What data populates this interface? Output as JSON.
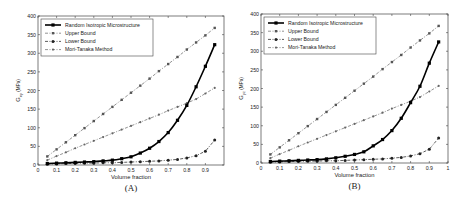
{
  "chart_data": [
    {
      "type": "line",
      "panel_label": "(A)",
      "title": "",
      "xlabel": "Volume fraction",
      "ylabel": "G_xy (MPa)",
      "ylabel_main": "G",
      "ylabel_sub": "xy",
      "ylabel_unit": "(MPa)",
      "xlim": [
        0,
        1
      ],
      "ylim": [
        0,
        400
      ],
      "xticks": [
        0,
        0.1,
        0.2,
        0.3,
        0.4,
        0.5,
        0.6,
        0.7,
        0.8,
        0.9
      ],
      "xtick_labels": [
        "0",
        "0.1",
        "0.2",
        "0.3",
        "0.4",
        "0.5",
        "0.6",
        "0.7",
        "0.8",
        "0.9"
      ],
      "yticks": [
        0,
        50,
        100,
        150,
        200,
        250,
        300,
        350,
        400
      ],
      "ytick_labels": [
        "0",
        "50",
        "100",
        "150",
        "200",
        "250",
        "300",
        "350",
        "400"
      ],
      "grid": false,
      "legend_position": "upper left",
      "x": [
        0.05,
        0.1,
        0.15,
        0.2,
        0.25,
        0.3,
        0.35,
        0.4,
        0.45,
        0.5,
        0.55,
        0.6,
        0.65,
        0.7,
        0.75,
        0.8,
        0.85,
        0.9,
        0.95
      ],
      "series": [
        {
          "name": "Random Isotropic Microstructure",
          "style": "solid-bold-square",
          "values": [
            4,
            5,
            6,
            7,
            8,
            9,
            11,
            13,
            17,
            22,
            32,
            45,
            63,
            87,
            120,
            160,
            210,
            265,
            323
          ]
        },
        {
          "name": "Upper Bound",
          "style": "dashdot-square",
          "values": [
            23,
            42,
            61,
            80,
            99,
            118,
            137,
            156,
            175,
            194,
            213,
            232,
            252,
            271,
            290,
            310,
            329,
            348,
            368
          ]
        },
        {
          "name": "Lower Bound",
          "style": "dashdot-star",
          "values": [
            2,
            3,
            4,
            4,
            5,
            5,
            6,
            6,
            7,
            8,
            9,
            10,
            11,
            13,
            15,
            19,
            25,
            37,
            67
          ]
        },
        {
          "name": "Mori-Tanaka Method",
          "style": "dashdot-dot",
          "values": [
            13,
            24,
            34,
            45,
            55,
            65,
            75,
            85,
            95,
            105,
            115,
            125,
            135,
            146,
            156,
            166,
            177,
            192,
            207
          ]
        }
      ]
    },
    {
      "type": "line",
      "panel_label": "(B)",
      "title": "",
      "xlabel": "Volume fraction",
      "ylabel": "G_yz (MPa)",
      "ylabel_main": "G",
      "ylabel_sub": "yz",
      "ylabel_unit": "(MPa)",
      "xlim": [
        0,
        1
      ],
      "ylim": [
        0,
        400
      ],
      "xticks": [
        0,
        0.1,
        0.2,
        0.3,
        0.4,
        0.5,
        0.6,
        0.7,
        0.8,
        0.9,
        1
      ],
      "xtick_labels": [
        "0",
        "0.1",
        "0.2",
        "0.3",
        "0.4",
        "0.5",
        "0.6",
        "0.7",
        "0.8",
        "0.9",
        "1"
      ],
      "yticks": [
        0,
        50,
        100,
        150,
        200,
        250,
        300,
        350,
        400
      ],
      "ytick_labels": [
        "0",
        "50",
        "100",
        "150",
        "200",
        "250",
        "300",
        "350",
        "400"
      ],
      "grid": false,
      "legend_position": "upper left",
      "x": [
        0.05,
        0.1,
        0.15,
        0.2,
        0.25,
        0.3,
        0.35,
        0.4,
        0.45,
        0.5,
        0.55,
        0.6,
        0.65,
        0.7,
        0.75,
        0.8,
        0.85,
        0.9,
        0.95
      ],
      "series": [
        {
          "name": "Random Isotropic Microstructure",
          "style": "solid-bold-square",
          "values": [
            4,
            5,
            6,
            7,
            8,
            9,
            11,
            14,
            18,
            23,
            30,
            46,
            63,
            87,
            120,
            162,
            206,
            268,
            325
          ]
        },
        {
          "name": "Upper Bound",
          "style": "dashdot-square",
          "values": [
            23,
            42,
            61,
            80,
            99,
            118,
            137,
            156,
            175,
            194,
            213,
            232,
            252,
            271,
            290,
            310,
            329,
            348,
            368
          ]
        },
        {
          "name": "Lower Bound",
          "style": "dashdot-star",
          "values": [
            2,
            3,
            4,
            4,
            5,
            5,
            6,
            6,
            7,
            8,
            9,
            10,
            11,
            13,
            15,
            19,
            25,
            37,
            67
          ]
        },
        {
          "name": "Mori-Tanaka Method",
          "style": "dashdot-dot",
          "values": [
            13,
            24,
            34,
            45,
            55,
            65,
            75,
            85,
            95,
            105,
            115,
            125,
            135,
            146,
            156,
            166,
            177,
            192,
            207
          ]
        }
      ]
    }
  ],
  "panels": [
    {
      "label": "(A)",
      "xlabel": "Volume fraction",
      "ylabel_main": "G",
      "ylabel_sub": "xy",
      "ylabel_unit": "(MPa)"
    },
    {
      "label": "(B)",
      "xlabel": "Volume fraction",
      "ylabel_main": "G",
      "ylabel_sub": "yz",
      "ylabel_unit": "(MPa)"
    }
  ],
  "legend": [
    "Random Isotropic Microstructure",
    "Upper Bound",
    "Lower Bound",
    "Mori-Tanaka Method"
  ]
}
